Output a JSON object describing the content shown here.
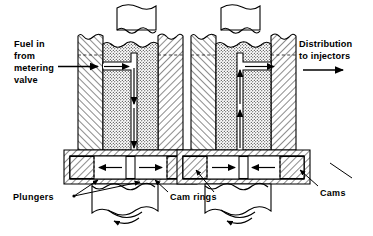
{
  "figure": {
    "kind": "engineering-cross-section",
    "background_color": "#ffffff",
    "line_color": "#000000",
    "hatch_color": "#000000",
    "views": 2
  },
  "labels": {
    "fuel_in": {
      "lines": [
        "Fuel in",
        "from",
        "metering",
        "valve"
      ],
      "line1": "Fuel in",
      "line2": "from",
      "line3": "metering",
      "line4": "valve",
      "position": "left"
    },
    "distribution": {
      "lines": [
        "Distribution",
        "to injectors"
      ],
      "line1": "Distribution",
      "line2": "to injectors",
      "position": "right"
    },
    "plungers": {
      "text": "Plungers",
      "position": "bottom-left"
    },
    "cam_rings": {
      "text": "Cam rings",
      "position": "bottom-center"
    },
    "cams": {
      "text": "Cams",
      "position": "bottom-right"
    }
  },
  "views": [
    {
      "name": "charging-view",
      "side": "left",
      "description": "Fuel enters from metering valve; plungers forced apart",
      "plunger_arrow_left": "←",
      "plunger_arrow_right": "→",
      "flow_direction": "inward-then-down"
    },
    {
      "name": "discharging-view",
      "side": "right",
      "description": "Cams force plungers together; fuel distributed to injectors",
      "plunger_arrow_left": "→",
      "plunger_arrow_right": "←",
      "flow_direction": "up-then-outward"
    }
  ],
  "flow_arrows": {
    "inlet": "arrow-right",
    "outlet": "arrow-right",
    "down": "arrow-down",
    "up": "arrow-up",
    "rotation": "arrow-rotation-ccw"
  },
  "colors": {
    "stroke": "#000000",
    "fill_white": "#ffffff",
    "hatch": "#000000"
  }
}
